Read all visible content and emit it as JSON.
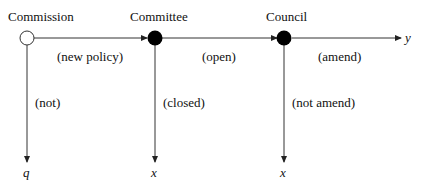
{
  "diagram": {
    "type": "sequential decision game tree",
    "nodes": [
      {
        "id": "commission",
        "label": "Commission",
        "fill": "open"
      },
      {
        "id": "committee",
        "label": "Committee",
        "fill": "filled"
      },
      {
        "id": "council",
        "label": "Council",
        "fill": "filled"
      }
    ],
    "edges": [
      {
        "from": "commission",
        "to": "committee",
        "label": "(new policy)"
      },
      {
        "from": "committee",
        "to": "council",
        "label": "(open)"
      },
      {
        "from": "council",
        "to": "y",
        "label": "(amend)"
      },
      {
        "from": "commission",
        "to": "q",
        "label": "(not)"
      },
      {
        "from": "committee",
        "to": "x1",
        "label": "(closed)"
      },
      {
        "from": "council",
        "to": "x2",
        "label": "(not amend)"
      }
    ],
    "outcomes": {
      "y": "y",
      "q": "q",
      "x1": "x",
      "x2": "x"
    },
    "colors": {
      "line": "#333333",
      "node_fill": "#000000",
      "open_fill": "#ffffff"
    }
  }
}
